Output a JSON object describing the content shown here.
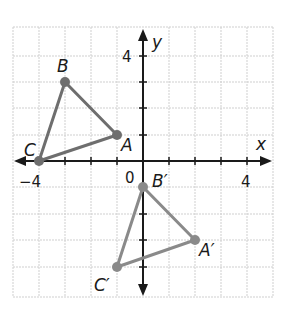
{
  "diagram": {
    "type": "coordinate-plane-transformation",
    "grid": {
      "xmin": -5,
      "xmax": 5,
      "ymin": -5,
      "ymax": 5,
      "step": 1,
      "color": "#c8c8c8"
    },
    "axes": {
      "x_label": "x",
      "y_label": "y",
      "origin_label": "0",
      "x_tick_labels": [
        {
          "value": -4,
          "text": "−4"
        },
        {
          "value": 4,
          "text": "4"
        }
      ],
      "y_tick_labels": [
        {
          "value": 4,
          "text": "4"
        }
      ],
      "color": "#1a1a1a"
    },
    "triangles": [
      {
        "name": "ABC",
        "color": "#6e6e6e",
        "vertices": [
          {
            "label": "A",
            "x": -1,
            "y": 1
          },
          {
            "label": "B",
            "x": -3,
            "y": 3
          },
          {
            "label": "C",
            "x": -4,
            "y": 0
          }
        ]
      },
      {
        "name": "A'B'C'",
        "color": "#8a8a8a",
        "vertices": [
          {
            "label": "A′",
            "x": 2,
            "y": -3
          },
          {
            "label": "B′",
            "x": 0,
            "y": -1
          },
          {
            "label": "C′",
            "x": -1,
            "y": -4
          }
        ]
      }
    ]
  }
}
